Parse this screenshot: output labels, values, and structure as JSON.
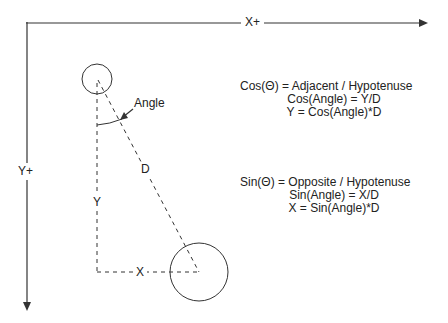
{
  "diagram": {
    "axes": {
      "x_label": "X+",
      "y_label": "Y+"
    },
    "labels": {
      "angle": "Angle",
      "d": "D",
      "y": "Y",
      "x": "X"
    },
    "cos_block": {
      "line1": "Cos(Θ) = Adjacent / Hypotenuse",
      "line2": "Cos(Angle) = Y/D",
      "line3": "Y = Cos(Angle)*D"
    },
    "sin_block": {
      "line1": "Sin(Θ) = Opposite / Hypotenuse",
      "line2": "Sin(Angle) = X/D",
      "line3": "X = Sin(Angle)*D"
    },
    "colors": {
      "stroke": "#333333",
      "text": "#222222",
      "background": "#ffffff"
    }
  }
}
